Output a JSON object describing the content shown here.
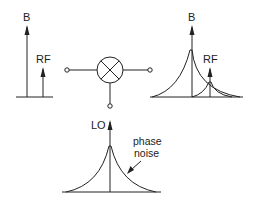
{
  "diagram": {
    "type": "mixer-spectrum-illustration",
    "line_color": "#222222",
    "panels": {
      "input_spectrum": {
        "labels": {
          "blocker": "B",
          "rf": "RF"
        }
      },
      "mixer": {
        "symbol": "mixer-x-circle-icon",
        "ports": [
          "input",
          "output",
          "lo"
        ]
      },
      "output_spectrum": {
        "labels": {
          "blocker": "B",
          "rf": "RF"
        }
      },
      "lo_spectrum": {
        "labels": {
          "lo": "LO",
          "phase_noise_line1": "phase",
          "phase_noise_line2": "noise"
        }
      }
    }
  }
}
